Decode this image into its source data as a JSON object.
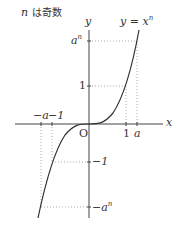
{
  "title": {
    "var": "n",
    "text": "は奇数"
  },
  "equation": {
    "lhs": "y",
    "eq": " = ",
    "base": "x",
    "exp": "n"
  },
  "axes": {
    "x_label": "x",
    "y_label": "y",
    "origin": "O"
  },
  "x_ticks": {
    "neg_a": "−a",
    "neg_1": "−1",
    "pos_1": "1",
    "pos_a": "a"
  },
  "y_ticks": {
    "an_base": "a",
    "an_exp": "n",
    "one": "1",
    "neg_one": "−1",
    "neg_an_base": "−a",
    "neg_an_exp": "n"
  },
  "colors": {
    "curve": "#333333",
    "axis": "#444444",
    "dotted": "#999999"
  }
}
